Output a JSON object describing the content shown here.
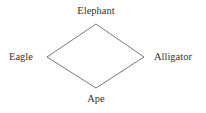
{
  "diagram": {
    "type": "diamond-graph",
    "nodes": [
      {
        "id": "top",
        "label": "Elephant"
      },
      {
        "id": "left",
        "label": "Eagle"
      },
      {
        "id": "right",
        "label": "Alligator"
      },
      {
        "id": "bottom",
        "label": "Ape"
      }
    ],
    "edges": [
      {
        "from": "Elephant",
        "to": "Eagle"
      },
      {
        "from": "Elephant",
        "to": "Alligator"
      },
      {
        "from": "Eagle",
        "to": "Ape"
      },
      {
        "from": "Alligator",
        "to": "Ape"
      }
    ],
    "colors": {
      "line": "#555555",
      "text": "#333333",
      "background": "#ffffff"
    }
  }
}
